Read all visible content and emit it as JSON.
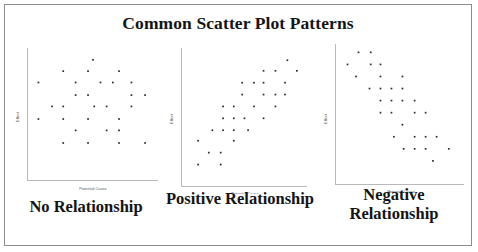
{
  "figure": {
    "title": "Common Scatter Plot Patterns",
    "border_color": "#8d8d8d",
    "background": "#ffffff"
  },
  "chart_data": [
    {
      "type": "scatter",
      "title": "No Relationship",
      "xlabel": "Potential Cause",
      "ylabel": "Effect",
      "xlim": [
        0,
        10
      ],
      "ylim": [
        0,
        10
      ],
      "grid": false,
      "legend": null,
      "marker_color": "#2b2b30",
      "axis_color": "#b9b9b9",
      "points": [
        [
          5.0,
          9.3
        ],
        [
          2.6,
          8.4
        ],
        [
          4.6,
          8.4
        ],
        [
          7.1,
          8.4
        ],
        [
          0.6,
          7.5
        ],
        [
          3.6,
          7.5
        ],
        [
          5.6,
          7.5
        ],
        [
          6.6,
          7.5
        ],
        [
          8.1,
          7.5
        ],
        [
          3.6,
          6.5
        ],
        [
          4.6,
          6.5
        ],
        [
          8.1,
          6.5
        ],
        [
          9.2,
          6.5
        ],
        [
          1.7,
          5.6
        ],
        [
          2.6,
          5.6
        ],
        [
          5.1,
          5.6
        ],
        [
          6.1,
          5.6
        ],
        [
          8.1,
          5.6
        ],
        [
          0.6,
          4.6
        ],
        [
          2.6,
          4.6
        ],
        [
          4.6,
          4.6
        ],
        [
          7.1,
          4.6
        ],
        [
          3.6,
          3.7
        ],
        [
          6.1,
          3.7
        ],
        [
          7.1,
          3.7
        ],
        [
          2.6,
          2.7
        ],
        [
          4.6,
          2.7
        ],
        [
          7.1,
          2.7
        ],
        [
          9.2,
          2.7
        ]
      ]
    },
    {
      "type": "scatter",
      "title": "Positive Relationship",
      "xlabel": "Potential Cause",
      "ylabel": "Effect",
      "xlim": [
        0,
        10
      ],
      "ylim": [
        0,
        10
      ],
      "grid": false,
      "legend": null,
      "marker_color": "#2b2b30",
      "axis_color": "#b9b9b9",
      "points": [
        [
          8.6,
          9.3
        ],
        [
          6.6,
          8.5
        ],
        [
          7.6,
          8.5
        ],
        [
          9.4,
          8.5
        ],
        [
          4.8,
          7.6
        ],
        [
          5.8,
          7.6
        ],
        [
          6.6,
          7.6
        ],
        [
          8.4,
          7.6
        ],
        [
          4.8,
          6.7
        ],
        [
          6.6,
          6.7
        ],
        [
          7.6,
          6.7
        ],
        [
          8.4,
          6.7
        ],
        [
          3.2,
          5.8
        ],
        [
          4.1,
          5.8
        ],
        [
          5.8,
          5.8
        ],
        [
          7.6,
          5.8
        ],
        [
          3.2,
          4.9
        ],
        [
          4.1,
          4.9
        ],
        [
          5.0,
          4.9
        ],
        [
          6.6,
          4.9
        ],
        [
          2.3,
          4.0
        ],
        [
          3.2,
          4.0
        ],
        [
          4.1,
          4.0
        ],
        [
          5.3,
          4.0
        ],
        [
          1.1,
          3.2
        ],
        [
          4.1,
          3.2
        ],
        [
          2.0,
          2.3
        ],
        [
          3.0,
          2.3
        ],
        [
          1.1,
          1.4
        ],
        [
          3.0,
          1.4
        ]
      ]
    },
    {
      "type": "scatter",
      "title": "Negative Relationship",
      "xlabel": "Potential Cause",
      "ylabel": "Effect",
      "xlim": [
        0,
        10
      ],
      "ylim": [
        0,
        10
      ],
      "grid": false,
      "legend": null,
      "marker_color": "#2b2b30",
      "axis_color": "#b9b9b9",
      "points": [
        [
          1.6,
          9.6
        ],
        [
          2.6,
          9.6
        ],
        [
          0.7,
          8.7
        ],
        [
          2.6,
          8.7
        ],
        [
          3.4,
          8.7
        ],
        [
          1.4,
          7.8
        ],
        [
          3.4,
          7.8
        ],
        [
          5.2,
          7.8
        ],
        [
          2.5,
          6.9
        ],
        [
          3.4,
          6.9
        ],
        [
          4.3,
          6.9
        ],
        [
          5.2,
          6.9
        ],
        [
          3.4,
          6.0
        ],
        [
          4.3,
          6.0
        ],
        [
          5.2,
          6.0
        ],
        [
          6.2,
          6.0
        ],
        [
          3.4,
          5.1
        ],
        [
          4.3,
          5.1
        ],
        [
          6.2,
          5.1
        ],
        [
          7.1,
          5.1
        ],
        [
          5.2,
          4.2
        ],
        [
          4.5,
          3.3
        ],
        [
          6.2,
          3.3
        ],
        [
          7.1,
          3.3
        ],
        [
          8.0,
          3.3
        ],
        [
          5.3,
          2.4
        ],
        [
          6.2,
          2.4
        ],
        [
          7.1,
          2.4
        ],
        [
          9.0,
          2.4
        ],
        [
          7.7,
          1.5
        ]
      ]
    }
  ]
}
